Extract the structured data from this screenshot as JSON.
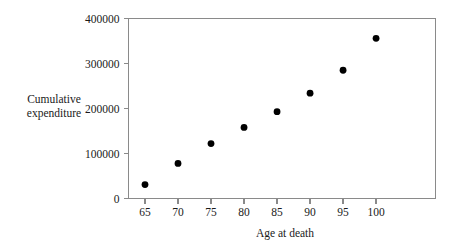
{
  "chart_data": {
    "type": "scatter",
    "title": "",
    "xlabel": "Age at death",
    "ylabel": "Cumulative\nexpenditure",
    "x": [
      65,
      70,
      75,
      80,
      85,
      90,
      95,
      100
    ],
    "values": [
      31000,
      78000,
      122000,
      158000,
      193000,
      234000,
      285000,
      356000
    ],
    "series": [
      {
        "name": "Cumulative expenditure",
        "values": [
          31000,
          78000,
          122000,
          158000,
          193000,
          234000,
          285000,
          356000
        ]
      }
    ],
    "points": [
      {
        "x": 65,
        "y": 31000
      },
      {
        "x": 70,
        "y": 78000
      },
      {
        "x": 75,
        "y": 122000
      },
      {
        "x": 80,
        "y": 158000
      },
      {
        "x": 85,
        "y": 193000
      },
      {
        "x": 90,
        "y": 234000
      },
      {
        "x": 95,
        "y": 285000
      },
      {
        "x": 100,
        "y": 356000
      }
    ],
    "xlim": [
      62.5,
      109
    ],
    "ylim": [
      0,
      400000
    ],
    "xticks": [
      65,
      70,
      75,
      80,
      85,
      90,
      95,
      100
    ],
    "xtick_labels": [
      "65",
      "70",
      "75",
      "80",
      "85",
      "90",
      "95",
      "100"
    ],
    "yticks": [
      0,
      100000,
      200000,
      300000,
      400000
    ],
    "ytick_labels": [
      "0",
      "100000",
      "200000",
      "300000",
      "400000"
    ],
    "grid": false,
    "legend": false,
    "marker": "filled-circle",
    "marker_color": "#000000",
    "axis_color": "#8a8a8a",
    "text_color": "#1a1a1a",
    "background": "#ffffff"
  },
  "axes": {
    "y_label_text": "Cumulative\nexpenditure",
    "x_label_text": "Age at death"
  }
}
